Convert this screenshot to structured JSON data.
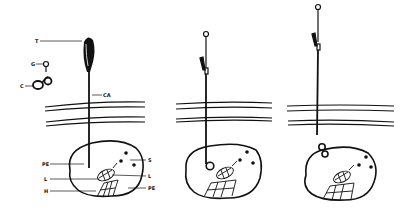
{
  "diagram": {
    "panels": [
      {
        "id": "panel-1",
        "description": "Instrument with T attached, guide G and coil C separate, inserted through layers into organ"
      },
      {
        "id": "panel-2",
        "description": "Coil positioned at tip inside organ"
      },
      {
        "id": "panel-3",
        "description": "Instrument withdrawn, coil left at organ surface"
      }
    ],
    "labels": {
      "T": "T",
      "G": "G",
      "C": "C",
      "CA": "CA",
      "PE_left": "PE",
      "S": "S",
      "L_left": "L",
      "L_right": "L",
      "H": "H",
      "PE_right": "PE"
    },
    "colors": {
      "ink": "#111111",
      "background": "#ffffff"
    }
  }
}
